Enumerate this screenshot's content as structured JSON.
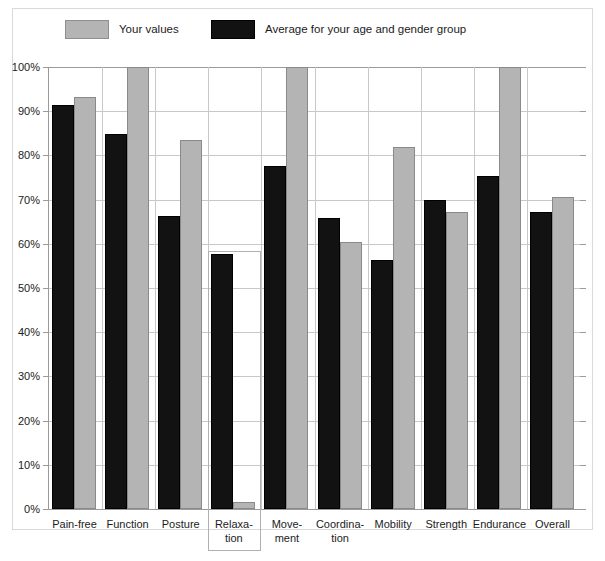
{
  "legend": {
    "items": [
      {
        "label": "Your values",
        "color": "#b4b4b4",
        "swatch": "gray"
      },
      {
        "label": "Average for your age and gender group",
        "color": "#121212",
        "swatch": "black"
      }
    ]
  },
  "highlight": {
    "category": "Relaxation",
    "border_color": "#b0b0b0"
  },
  "chart_data": {
    "type": "bar",
    "title": "",
    "xlabel": "",
    "ylabel": "",
    "ylim": [
      0,
      100
    ],
    "ytick_labels": [
      "0%",
      "10%",
      "20%",
      "30%",
      "40%",
      "50%",
      "60%",
      "70%",
      "80%",
      "90%",
      "100%"
    ],
    "ytick_values": [
      0,
      10,
      20,
      30,
      40,
      50,
      60,
      70,
      80,
      90,
      100
    ],
    "grid": true,
    "legend_position": "top-left",
    "categories": [
      "Pain-free",
      "Function",
      "Posture",
      "Relaxation",
      "Movement",
      "Coordination",
      "Mobility",
      "Strength",
      "Endurance",
      "Overall"
    ],
    "category_lines": [
      [
        "Pain-free"
      ],
      [
        "Function"
      ],
      [
        "Posture"
      ],
      [
        "Relaxa-",
        "tion"
      ],
      [
        "Move-",
        "ment"
      ],
      [
        "Coordina-",
        "tion"
      ],
      [
        "Mobility"
      ],
      [
        "Strength"
      ],
      [
        "Endurance"
      ],
      [
        "Overall"
      ]
    ],
    "series": [
      {
        "name": "Average for your age and gender group",
        "color": "#121212",
        "values": [
          91.5,
          84.9,
          66.3,
          57.6,
          77.5,
          65.8,
          56.3,
          69.8,
          75.3,
          67.1
        ]
      },
      {
        "name": "Your values",
        "color": "#b4b4b4",
        "values": [
          93.3,
          100.0,
          83.5,
          1.5,
          100.0,
          60.3,
          81.8,
          67.2,
          100.0,
          70.5
        ]
      }
    ]
  }
}
